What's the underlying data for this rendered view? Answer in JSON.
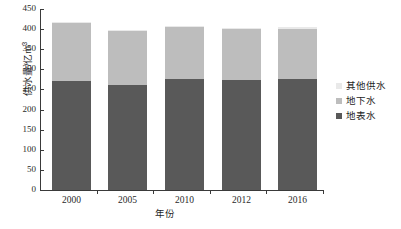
{
  "chart_data": {
    "type": "bar",
    "title": "",
    "subtitle": "",
    "stacked": true,
    "categories": [
      "2000",
      "2005",
      "2010",
      "2012",
      "2016"
    ],
    "series": [
      {
        "name": "地表水",
        "color": "#595959",
        "values": [
          272,
          262,
          277,
          274,
          277
        ]
      },
      {
        "name": "地下水",
        "color": "#bdbdbd",
        "values": [
          145,
          136,
          130,
          129,
          123
        ]
      },
      {
        "name": "其他供水",
        "color": "#e9e9e9",
        "values": [
          1,
          1,
          1,
          1,
          6
        ]
      }
    ],
    "totals": [
      418,
      399,
      408,
      404,
      406
    ],
    "xlabel": "年份",
    "ylabel": "供水量/亿m³",
    "ylabel_main": "供水量/亿m",
    "ylabel_sup": "3",
    "ylim": [
      0,
      450
    ],
    "ytick_step": 50,
    "yticks": [
      "450",
      "400",
      "350",
      "300",
      "250",
      "200",
      "150",
      "100",
      "50",
      "0"
    ],
    "ytick_values": [
      450,
      400,
      350,
      300,
      250,
      200,
      150,
      100,
      50,
      0
    ],
    "grid": false,
    "legend_position": "right"
  },
  "legend": {
    "items": [
      {
        "label": "其他供水",
        "color": "#e9e9e9"
      },
      {
        "label": "地下水",
        "color": "#bdbdbd"
      },
      {
        "label": "地表水",
        "color": "#595959"
      }
    ]
  }
}
